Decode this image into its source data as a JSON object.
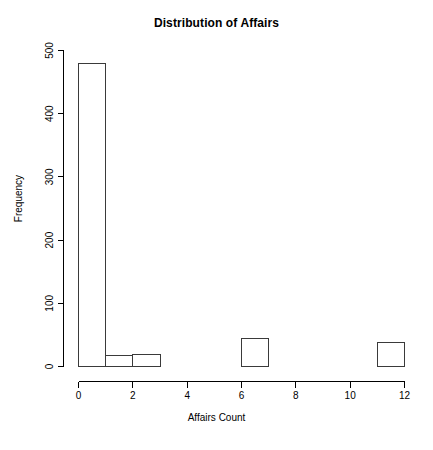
{
  "chart_data": {
    "type": "bar",
    "title": "Distribution of Affairs",
    "xlabel": "Affairs Count",
    "ylabel": "Frequency",
    "subtitle": "",
    "grid": false,
    "legend": false,
    "legend_position": "none",
    "xlim": [
      0,
      12
    ],
    "ylim": [
      0,
      500
    ],
    "xticks": [
      0,
      2,
      4,
      6,
      8,
      10,
      12
    ],
    "xtick_labels": [
      "0",
      "2",
      "4",
      "6",
      "8",
      "10",
      "12"
    ],
    "yticks": [
      0,
      100,
      200,
      300,
      400,
      500
    ],
    "ytick_labels": [
      "0",
      "100",
      "200",
      "300",
      "400",
      "500"
    ],
    "bin_width": 1,
    "bin_edges": [
      0,
      1,
      2,
      3,
      6,
      7,
      11,
      12
    ],
    "categories": [
      "0-1",
      "1-2",
      "2-3",
      "6-7",
      "11-12"
    ],
    "bars": [
      {
        "label": "0-1",
        "x0": 0,
        "x1": 1,
        "value": 480
      },
      {
        "label": "1-2",
        "x0": 1,
        "x1": 2,
        "value": 17
      },
      {
        "label": "2-3",
        "x0": 2,
        "x1": 3,
        "value": 19
      },
      {
        "label": "6-7",
        "x0": 6,
        "x1": 7,
        "value": 45
      },
      {
        "label": "11-12",
        "x0": 11,
        "x1": 12,
        "value": 38
      }
    ],
    "values": [
      480,
      17,
      19,
      45,
      38
    ],
    "colors": {
      "background": "#ffffff",
      "bar_fill": "#ffffff",
      "bar_stroke": "#3a3a3a",
      "axis": "#000000",
      "text": "#000000"
    }
  }
}
